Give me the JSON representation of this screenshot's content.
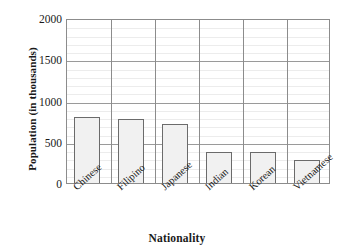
{
  "chart_data": {
    "type": "bar",
    "title": "",
    "xlabel": "Nationality",
    "ylabel": "Population (in thousands)",
    "categories": [
      "Chinese",
      "Filipino",
      "Japanese",
      "Indian",
      "Korean",
      "Vietnamese"
    ],
    "values": [
      800,
      775,
      710,
      375,
      370,
      275
    ],
    "ylim": [
      0,
      2000
    ],
    "yticks": [
      0,
      500,
      1000,
      1500,
      2000
    ],
    "ytick_labels": [
      "0",
      "500",
      "1000",
      "1500",
      "2000"
    ],
    "y_minor_tick_step": 100,
    "grid": "horizontal-minor-and-major-plus-category-separators",
    "legend": "none",
    "bar_fill_color": "#f1f1f1",
    "bar_border_color": "#6b6b6b",
    "grid_minor_color": "#ececec",
    "grid_major_color": "#9a9a9a",
    "axis_color": "#8c8c8c",
    "plot_background": "#ffffff"
  }
}
